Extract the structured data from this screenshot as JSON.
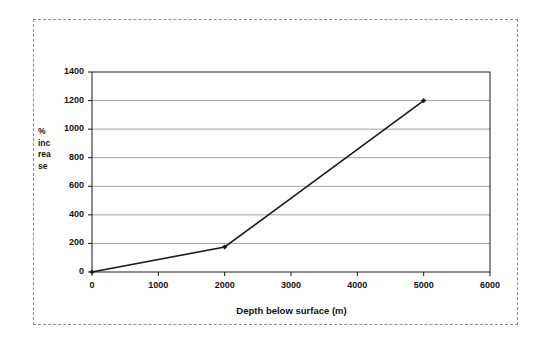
{
  "figure": {
    "name": "depth-vs-percent-increase-line-chart",
    "frame_style": "dashed-scan-border"
  },
  "chart_data": {
    "type": "line",
    "title": "",
    "subtitle": "",
    "xlabel": "Depth below surface (m)",
    "ylabel": "% increase",
    "ylabel_wrapped": [
      "%",
      "inc",
      "rea",
      "se"
    ],
    "x": [
      0,
      2000,
      5000
    ],
    "values": [
      0,
      175,
      1200
    ],
    "series": [
      {
        "name": "% increase",
        "x": [
          0,
          2000,
          5000
        ],
        "values": [
          0,
          175,
          1200
        ]
      }
    ],
    "xlim": [
      0,
      6000
    ],
    "ylim": [
      0,
      1400
    ],
    "xticks": [
      0,
      1000,
      2000,
      3000,
      4000,
      5000,
      6000
    ],
    "yticks": [
      0,
      200,
      400,
      600,
      800,
      1000,
      1200,
      1400
    ],
    "xtick_labels": [
      "0",
      "1000",
      "2000",
      "3000",
      "4000",
      "5000",
      "6000"
    ],
    "ytick_labels": [
      "0",
      "200",
      "400",
      "600",
      "800",
      "1000",
      "1200",
      "1400"
    ],
    "grid": "horizontal",
    "legend": "none",
    "marker": "filled-diamond",
    "line_color": "#1a1a1a",
    "grid_color": "#9a9a9a",
    "axis_color": "#1a1a1a",
    "plot_background": "#ffffff"
  }
}
